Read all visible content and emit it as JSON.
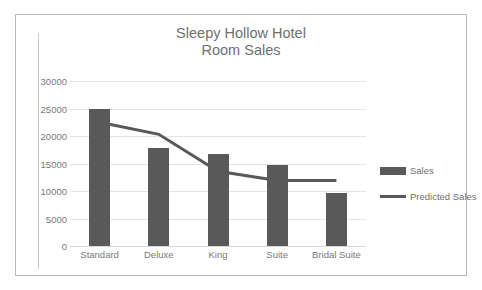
{
  "chart_data": {
    "type": "bar",
    "title": "Sleepy Hollow Hotel Room Sales",
    "title_lines": [
      "Sleepy Hollow Hotel",
      "Room Sales"
    ],
    "categories": [
      "Standard",
      "Deluxe",
      "King",
      "Suite",
      "Bridal Suite"
    ],
    "series": [
      {
        "name": "Sales",
        "type": "bar",
        "color": "#595959",
        "values": [
          25000,
          17800,
          16700,
          14700,
          9700
        ]
      },
      {
        "name": "Predicted Sales",
        "type": "line",
        "color": "#595959",
        "values": [
          22500,
          20300,
          13600,
          11900,
          11900
        ]
      }
    ],
    "xlabel": "",
    "ylabel": "",
    "ylim": [
      0,
      30000
    ],
    "ytick_values": [
      0,
      5000,
      10000,
      15000,
      20000,
      25000,
      30000
    ],
    "ytick_labels": [
      "0",
      "5000",
      "10000",
      "15000",
      "20000",
      "25000",
      "30000"
    ],
    "grid": true,
    "legend_position": "right"
  },
  "legend": {
    "items": [
      {
        "label": "Sales",
        "marker": "bar-swatch"
      },
      {
        "label": "Predicted Sales",
        "marker": "line-swatch"
      }
    ]
  }
}
